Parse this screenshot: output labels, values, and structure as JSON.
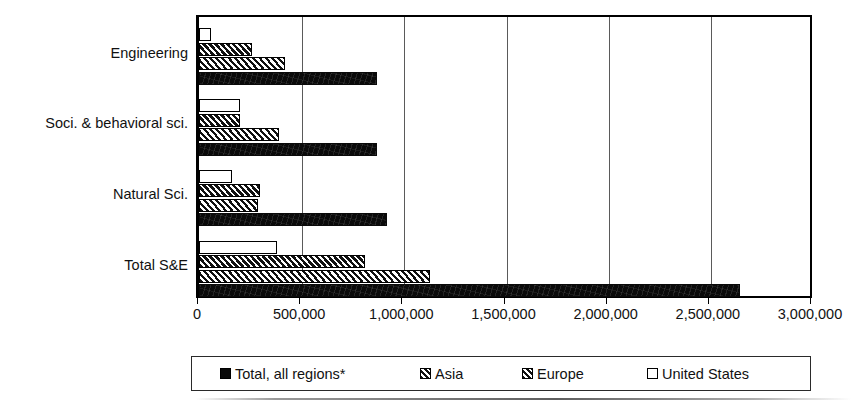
{
  "chart_data": {
    "type": "bar",
    "orientation": "horizontal",
    "title": "",
    "xlabel": "",
    "ylabel": "",
    "xlim": [
      0,
      3000000
    ],
    "grid": true,
    "legend_position": "bottom",
    "categories": [
      "Engineering",
      "Soci. & behavioral sci.",
      "Natural Sci.",
      "Total S&E"
    ],
    "xtick_labels": [
      "0",
      "500,000",
      "1,000,000",
      "1,500,000",
      "2,000,000",
      "2,500,000",
      "3,000,000"
    ],
    "xtick_values": [
      0,
      500000,
      1000000,
      1500000,
      2000000,
      2500000,
      3000000
    ],
    "series": [
      {
        "name": "Total, all regions*",
        "pattern": "solid-black",
        "color": "#0a0a0a",
        "values": [
          870000,
          870000,
          920000,
          2650000
        ]
      },
      {
        "name": "Asia",
        "pattern": "diagonal-hatch",
        "color": "#d8d8d8",
        "values": [
          420000,
          390000,
          290000,
          1130000
        ]
      },
      {
        "name": "Europe",
        "pattern": "dense-cross-hatch",
        "color": "#cfcfcf",
        "values": [
          260000,
          200000,
          300000,
          810000
        ]
      },
      {
        "name": "United States",
        "pattern": "open-white",
        "color": "#ffffff",
        "values": [
          60000,
          200000,
          160000,
          380000
        ]
      }
    ]
  },
  "legend": {
    "items": [
      {
        "label": "Total, all regions*",
        "swatch": "solid"
      },
      {
        "label": "Asia",
        "swatch": "hatch-asia"
      },
      {
        "label": "Europe",
        "swatch": "hatch-europe"
      },
      {
        "label": "United States",
        "swatch": "open"
      }
    ]
  }
}
